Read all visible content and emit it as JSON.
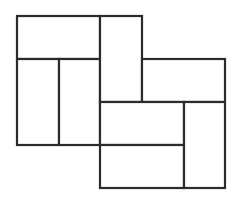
{
  "diagram": {
    "type": "rectangle-tiling",
    "unit": 42,
    "stroke_color": "#2b2b2b",
    "background": "#ffffff",
    "rectangles": [
      {
        "id": "r1",
        "x": 17,
        "y": 16,
        "w": 83,
        "h": 43,
        "orientation": "horizontal"
      },
      {
        "id": "r2",
        "x": 17,
        "y": 59,
        "w": 42,
        "h": 86,
        "orientation": "vertical"
      },
      {
        "id": "r3",
        "x": 59,
        "y": 59,
        "w": 41,
        "h": 86,
        "orientation": "vertical"
      },
      {
        "id": "r4",
        "x": 100,
        "y": 16,
        "w": 42,
        "h": 86,
        "orientation": "vertical"
      },
      {
        "id": "r5",
        "x": 142,
        "y": 59,
        "w": 83,
        "h": 43,
        "orientation": "horizontal"
      },
      {
        "id": "r6",
        "x": 100,
        "y": 102,
        "w": 84,
        "h": 43,
        "orientation": "horizontal"
      },
      {
        "id": "r7",
        "x": 100,
        "y": 145,
        "w": 84,
        "h": 43,
        "orientation": "horizontal"
      },
      {
        "id": "r8",
        "x": 184,
        "y": 102,
        "w": 41,
        "h": 86,
        "orientation": "vertical"
      }
    ]
  }
}
